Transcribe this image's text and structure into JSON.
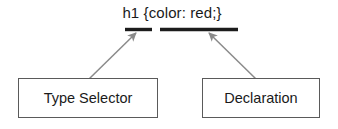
{
  "diagram": {
    "code": {
      "full_text": "h1 {color: red;}",
      "selector_part": "h1",
      "declaration_part": "{color: red;}"
    },
    "nodes": [
      {
        "id": "type-selector",
        "label": "Type Selector"
      },
      {
        "id": "declaration",
        "label": "Declaration"
      }
    ],
    "underlines": [
      {
        "target": "type-selector",
        "x1": 125,
        "x2": 152,
        "y": 29
      },
      {
        "target": "declaration",
        "x1": 160,
        "x2": 238,
        "y": 29
      }
    ],
    "arrows": [
      {
        "from": "type-selector",
        "to": "selector-underline",
        "x1": 89,
        "y1": 79,
        "x2": 138,
        "y2": 31
      },
      {
        "from": "declaration",
        "to": "declaration-underline",
        "x1": 256,
        "y1": 79,
        "x2": 207,
        "y2": 31
      }
    ],
    "colors": {
      "background": "#ffffff",
      "text": "#1a1a1a",
      "box_border": "#5a5a5a",
      "underline": "#1c1c1c",
      "arrow": "#8a8a8a"
    }
  }
}
